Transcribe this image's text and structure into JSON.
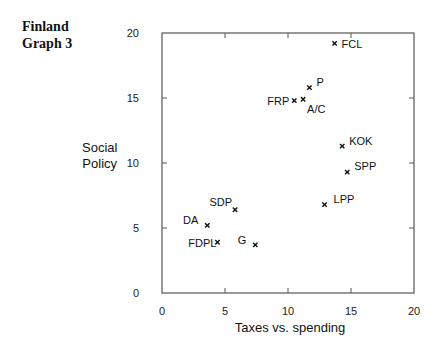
{
  "figure": {
    "title_line1": "Finland",
    "title_line2": "Graph 3",
    "ylabel_line1": "Social",
    "ylabel_line2": "Policy",
    "xlabel": "Taxes vs. spending"
  },
  "chart_data": {
    "type": "scatter",
    "title": "Finland Graph 3",
    "xlabel": "Taxes vs. spending",
    "ylabel": "Social Policy",
    "xlim": [
      0,
      20
    ],
    "ylim": [
      0,
      20
    ],
    "xticks": [
      0,
      5,
      10,
      15,
      20
    ],
    "yticks": [
      0,
      5,
      10,
      15,
      20
    ],
    "grid": false,
    "legend": null,
    "marker": "x",
    "points": [
      {
        "label": "FCL",
        "x": 13.7,
        "y": 19.2
      },
      {
        "label": "P",
        "x": 11.7,
        "y": 15.8
      },
      {
        "label": "FRP",
        "x": 10.5,
        "y": 14.8
      },
      {
        "label": "A/C",
        "x": 11.2,
        "y": 14.9
      },
      {
        "label": "KOK",
        "x": 14.3,
        "y": 11.3
      },
      {
        "label": "SPP",
        "x": 14.7,
        "y": 9.3
      },
      {
        "label": "LPP",
        "x": 12.9,
        "y": 6.8
      },
      {
        "label": "SDP",
        "x": 5.8,
        "y": 6.4
      },
      {
        "label": "DA",
        "x": 3.6,
        "y": 5.2
      },
      {
        "label": "FDPL",
        "x": 4.4,
        "y": 3.9
      },
      {
        "label": "G",
        "x": 7.4,
        "y": 3.7
      }
    ]
  },
  "style": {
    "axis_color": "#555555",
    "marker_color": "#111111",
    "text_color": "#111111"
  }
}
